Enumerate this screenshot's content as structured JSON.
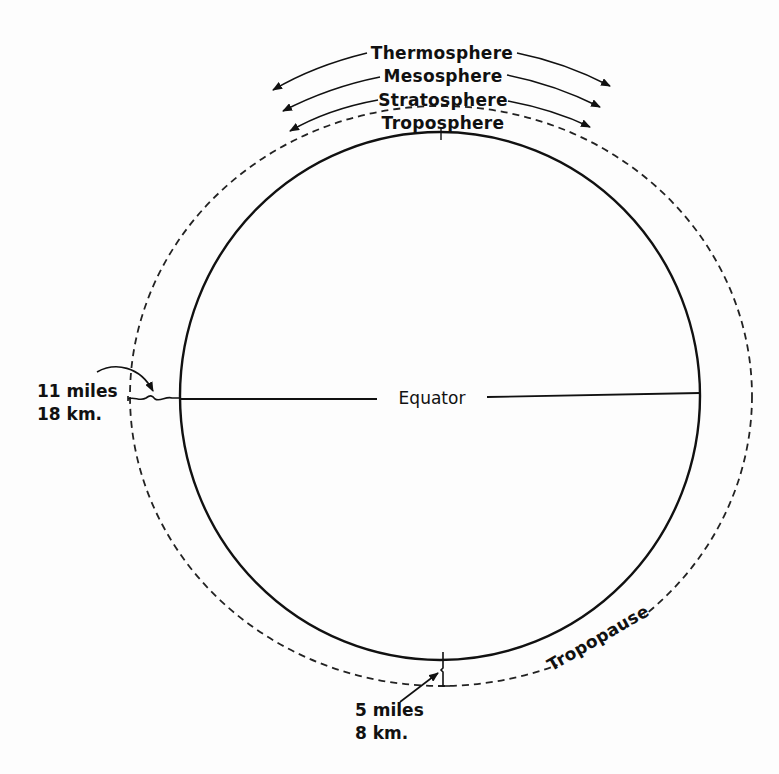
{
  "figure": {
    "type": "atmosphere-cross-section",
    "colors": {
      "ink": "#111111",
      "paper": "#fdfdfd"
    },
    "layers": [
      {
        "label": "Thermosphere"
      },
      {
        "label": "Mesosphere"
      },
      {
        "label": "Stratosphere"
      },
      {
        "label": "Troposphere"
      }
    ],
    "boundary": {
      "label": "Tropopause"
    },
    "equator": {
      "label": "Equator"
    },
    "equator_height": {
      "line1": "11 miles",
      "line2": "18 km."
    },
    "pole_height": {
      "line1": "5 miles",
      "line2": "8 km."
    }
  }
}
